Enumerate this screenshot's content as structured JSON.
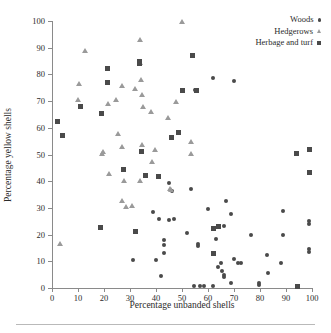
{
  "chart_data": {
    "type": "scatter",
    "title": "",
    "xlabel": "Percentage unbanded shells",
    "ylabel": "Percentage yellow shells",
    "xlim": [
      0,
      100
    ],
    "ylim": [
      0,
      100
    ],
    "xticks": [
      0,
      10,
      20,
      30,
      40,
      50,
      60,
      70,
      80,
      90,
      100
    ],
    "yticks": [
      0,
      10,
      20,
      30,
      40,
      50,
      60,
      70,
      80,
      90,
      100
    ],
    "grid": false,
    "legend_position": "top-right",
    "series": [
      {
        "name": "Woods",
        "marker": "circle",
        "color": "#4a4a4a",
        "points": [
          [
            62.0,
            78.8
          ],
          [
            55.0,
            74.0
          ],
          [
            45.0,
            39.4
          ],
          [
            60.0,
            29.5
          ],
          [
            47.0,
            26.0
          ],
          [
            39.0,
            28.6
          ],
          [
            41.0,
            26.0
          ],
          [
            45.0,
            25.6
          ],
          [
            43.0,
            18.0
          ],
          [
            52.0,
            20.6
          ],
          [
            56.0,
            15.6
          ],
          [
            56.0,
            16.3
          ],
          [
            43.0,
            16.2
          ],
          [
            43.0,
            13.0
          ],
          [
            40.0,
            10.3
          ],
          [
            31.0,
            10.4
          ],
          [
            42.0,
            4.4
          ],
          [
            54.5,
            0.6
          ],
          [
            57.0,
            0.6
          ],
          [
            58.5,
            0.6
          ],
          [
            62.0,
            0.6
          ],
          [
            66.0,
            5.0
          ],
          [
            66.0,
            4.0
          ],
          [
            65.5,
            6.3
          ],
          [
            64.0,
            7.8
          ],
          [
            65.0,
            9.5
          ],
          [
            63.0,
            18.4
          ],
          [
            66.0,
            23.4
          ],
          [
            67.0,
            32.6
          ],
          [
            69.0,
            27.8
          ],
          [
            70.0,
            11.0
          ],
          [
            71.5,
            9.4
          ],
          [
            72.5,
            9.4
          ],
          [
            69.0,
            1.7
          ],
          [
            76.5,
            19.8
          ],
          [
            79.5,
            1.0
          ],
          [
            79.5,
            2.0
          ],
          [
            83.0,
            5.5
          ],
          [
            82.5,
            12.2
          ],
          [
            88.0,
            9.5
          ],
          [
            89.0,
            28.9
          ],
          [
            89.0,
            20.0
          ],
          [
            99.0,
            25.2
          ],
          [
            99.0,
            24.0
          ],
          [
            99.0,
            14.5
          ],
          [
            99.0,
            13.4
          ],
          [
            53.5,
            37.0
          ],
          [
            46.0,
            36.5
          ],
          [
            70.0,
            77.5
          ]
        ]
      },
      {
        "name": "Hedgerows",
        "marker": "triangle",
        "color": "#9a9a9a",
        "points": [
          [
            3.0,
            16.6
          ],
          [
            10.0,
            70.5
          ],
          [
            10.5,
            76.6
          ],
          [
            12.8,
            89.0
          ],
          [
            19.2,
            50.4
          ],
          [
            19.8,
            51.0
          ],
          [
            21.5,
            69.0
          ],
          [
            22.0,
            42.8
          ],
          [
            24.5,
            70.4
          ],
          [
            25.5,
            57.9
          ],
          [
            27.0,
            75.9
          ],
          [
            26.8,
            52.8
          ],
          [
            27.5,
            40.2
          ],
          [
            26.8,
            32.8
          ],
          [
            28.5,
            30.5
          ],
          [
            30.8,
            30.9
          ],
          [
            32.0,
            74.7
          ],
          [
            33.8,
            92.9
          ],
          [
            34.0,
            84.3
          ],
          [
            34.2,
            78.2
          ],
          [
            34.5,
            72.5
          ],
          [
            35.0,
            68.0
          ],
          [
            34.5,
            53.8
          ],
          [
            34.0,
            40.3
          ],
          [
            38.0,
            66.2
          ],
          [
            38.5,
            47.5
          ],
          [
            39.5,
            51.8
          ],
          [
            44.5,
            64.0
          ],
          [
            45.5,
            37.2
          ],
          [
            45.8,
            36.7
          ],
          [
            47.5,
            69.8
          ],
          [
            53.5,
            54.8
          ],
          [
            53.5,
            50.5
          ],
          [
            50.0,
            99.8
          ]
        ]
      },
      {
        "name": "Herbage and turf",
        "marker": "square",
        "color": "#4a4a4a",
        "points": [
          [
            2.0,
            62.2
          ],
          [
            4.0,
            57.0
          ],
          [
            11.0,
            68.0
          ],
          [
            18.8,
            22.6
          ],
          [
            19.0,
            65.2
          ],
          [
            21.5,
            82.2
          ],
          [
            21.5,
            76.9
          ],
          [
            27.5,
            44.2
          ],
          [
            32.0,
            21.2
          ],
          [
            33.8,
            85.0
          ],
          [
            33.8,
            84.0
          ],
          [
            34.5,
            51.0
          ],
          [
            36.0,
            42.3
          ],
          [
            41.0,
            41.9
          ],
          [
            46.0,
            56.2
          ],
          [
            48.5,
            58.3
          ],
          [
            50.0,
            74.0
          ],
          [
            54.0,
            87.2
          ],
          [
            55.5,
            74.0
          ],
          [
            62.0,
            22.4
          ],
          [
            62.0,
            13.0
          ],
          [
            64.0,
            23.2
          ],
          [
            94.0,
            50.4
          ],
          [
            94.5,
            0.5
          ],
          [
            99.0,
            51.8
          ],
          [
            99.0,
            43.4
          ]
        ]
      }
    ]
  },
  "legend": {
    "items": [
      {
        "label": "Woods",
        "marker": "woods"
      },
      {
        "label": "Hedgerows",
        "marker": "hedgerows"
      },
      {
        "label": "Herbage and turf",
        "marker": "herbage"
      }
    ]
  }
}
